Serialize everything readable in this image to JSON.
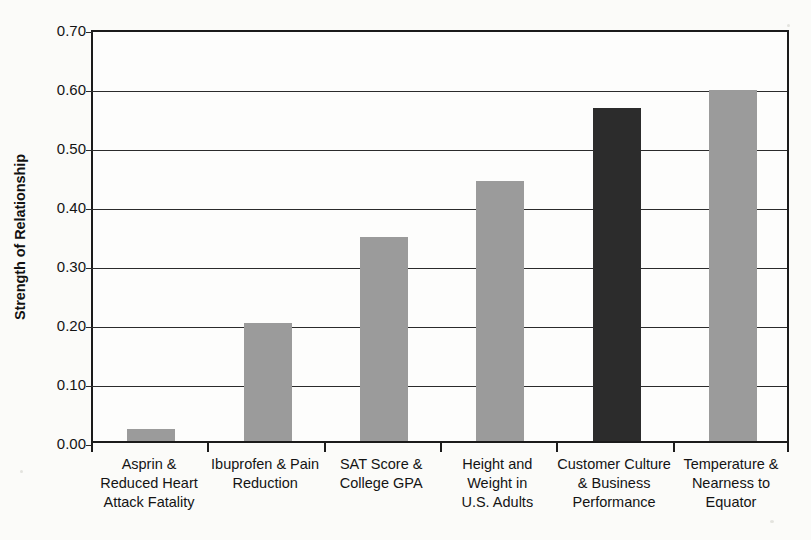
{
  "chart_data": {
    "type": "bar",
    "title": "",
    "xlabel": "",
    "ylabel": "Strength of Relationship",
    "ylim": [
      0.0,
      0.7
    ],
    "ytick_step": 0.1,
    "grid": true,
    "legend": "none",
    "ytick_labels": [
      "0.70",
      "0.60",
      "0.50",
      "0.40",
      "0.30",
      "0.20",
      "0.10",
      "0.00"
    ],
    "ytick_values": [
      0.7,
      0.6,
      0.5,
      0.4,
      0.3,
      0.2,
      0.1,
      0.0
    ],
    "categories": [
      "Asprin & Reduced Heart Attack Fatality",
      "Ibuprofen & Pain Reduction",
      "SAT Score & College GPA",
      "Height and Weight in U.S. Adults",
      "Customer Culture & Business Performance",
      "Temperature & Nearness to Equator"
    ],
    "category_lines": [
      [
        "Asprin &",
        "Reduced Heart",
        "Attack Fatality"
      ],
      [
        "Ibuprofen & Pain",
        "Reduction"
      ],
      [
        "SAT Score &",
        "College GPA"
      ],
      [
        "Height and",
        "Weight in",
        "U.S. Adults"
      ],
      [
        "Customer Culture",
        "& Business",
        "Performance"
      ],
      [
        "Temperature &",
        "Nearness to",
        "Equator"
      ]
    ],
    "values": [
      0.02,
      0.2,
      0.345,
      0.44,
      0.565,
      0.595
    ],
    "bar_colors": [
      "#9b9b9b",
      "#9b9b9b",
      "#9b9b9b",
      "#9b9b9b",
      "#2c2c2c",
      "#9b9b9b"
    ],
    "highlighted_index": 4
  },
  "colors": {
    "bar_gray": "#9b9b9b",
    "bar_dark": "#2c2c2c",
    "axis": "#1b1b1b",
    "grid": "#2b2b2b",
    "background": "#fbfbf9",
    "text": "#141414"
  }
}
